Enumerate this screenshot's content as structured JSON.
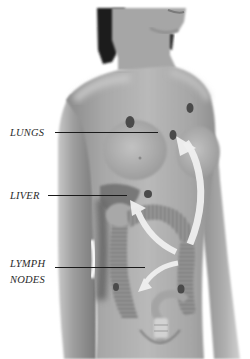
{
  "figure": {
    "palette": {
      "background": "#ffffff",
      "skin_light": "#bdbdbd",
      "skin_mid": "#a3a3a3",
      "skin_dark": "#7d7d7d",
      "hair": "#1b1b1b",
      "tumor": "#4a4a4a",
      "arrow": "#efefef",
      "label_text": "#2a2a2a",
      "leader_line": "#1a1a1a"
    }
  },
  "labels": {
    "lungs": "LUNGS",
    "liver": "LIVER",
    "lymph_line1": "LYMPH",
    "lymph_line2": "NODES"
  },
  "spots": [
    {
      "name": "lung-spot-left",
      "cx": 130,
      "cy": 122,
      "rx": 4.5,
      "ry": 6
    },
    {
      "name": "lung-spot-right-upper",
      "cx": 190,
      "cy": 108,
      "rx": 3.5,
      "ry": 5
    },
    {
      "name": "lung-spot-right-lower",
      "cx": 173,
      "cy": 135,
      "rx": 3.5,
      "ry": 5
    },
    {
      "name": "liver-spot",
      "cx": 148,
      "cy": 194,
      "rx": 4,
      "ry": 4
    },
    {
      "name": "colon-spot",
      "cx": 181,
      "cy": 289,
      "rx": 3.5,
      "ry": 4.5
    },
    {
      "name": "lymph-spot",
      "cx": 116,
      "cy": 287,
      "rx": 3,
      "ry": 4
    }
  ]
}
